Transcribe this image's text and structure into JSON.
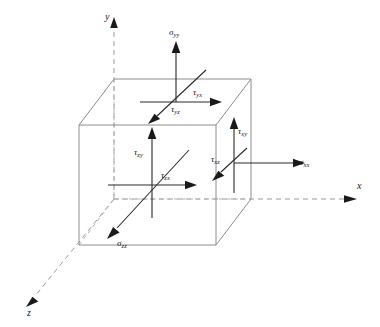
{
  "figure": {
    "background_color": "#ffffff",
    "axis_color": "#9a9a9a",
    "cube_edge_color": "#8c8c8c",
    "cube_hidden_edge_color": "#b4b4b4",
    "arrow_color": "#1a1a1a",
    "label_color": "#1a1a1a"
  },
  "axes": [
    {
      "name": "y-axis",
      "label": "y",
      "direction": "up"
    },
    {
      "name": "x-axis",
      "label": "x",
      "direction": "right"
    },
    {
      "name": "z-axis",
      "label": "z",
      "direction": "down-left"
    }
  ],
  "stress_components": [
    {
      "id": "sigma-yy",
      "face": "top",
      "symbol": "σ",
      "subscript": "yy",
      "type": "normal",
      "direction": "up"
    },
    {
      "id": "tau-yx",
      "face": "top",
      "symbol": "τ",
      "subscript": "yx",
      "type": "shear",
      "direction": "right"
    },
    {
      "id": "tau-yz",
      "face": "top",
      "symbol": "τ",
      "subscript": "yz",
      "type": "shear",
      "direction": "down-left"
    },
    {
      "id": "sigma-xx",
      "face": "right",
      "symbol": "σ",
      "subscript": "xx",
      "type": "normal",
      "direction": "right"
    },
    {
      "id": "tau-xy",
      "face": "right",
      "symbol": "τ",
      "subscript": "xy",
      "type": "shear",
      "direction": "up"
    },
    {
      "id": "tau-xz",
      "face": "right",
      "symbol": "τ",
      "subscript": "xz",
      "type": "shear",
      "direction": "down-left"
    },
    {
      "id": "sigma-zz",
      "face": "front",
      "symbol": "σ",
      "subscript": "zz",
      "type": "normal",
      "direction": "down-left"
    },
    {
      "id": "tau-zy",
      "face": "front",
      "symbol": "τ",
      "subscript": "zy",
      "type": "shear",
      "direction": "up"
    },
    {
      "id": "tau-zx",
      "face": "front",
      "symbol": "τ",
      "subscript": "zx",
      "type": "shear",
      "direction": "right"
    }
  ]
}
